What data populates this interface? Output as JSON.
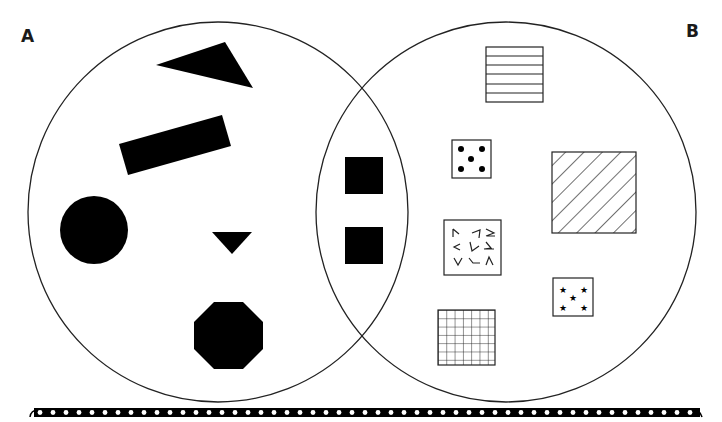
{
  "diagram": {
    "type": "venn",
    "sets": [
      {
        "id": "A",
        "label": "A",
        "center": [
          218,
          212
        ],
        "radius": 190
      },
      {
        "id": "B",
        "label": "B",
        "center": [
          506,
          212
        ],
        "radius": 190
      }
    ],
    "colors": {
      "stroke": "#222222",
      "fill": "#000000",
      "background": "#ffffff"
    },
    "only_a": [
      {
        "shape": "triangle",
        "style": "solid-black"
      },
      {
        "shape": "rectangle-rotated",
        "style": "solid-black"
      },
      {
        "shape": "circle",
        "style": "solid-black"
      },
      {
        "shape": "triangle-small-inverted",
        "style": "solid-black"
      },
      {
        "shape": "octagon",
        "style": "solid-black"
      }
    ],
    "intersection": [
      {
        "shape": "square",
        "style": "solid-black"
      },
      {
        "shape": "square",
        "style": "solid-black"
      }
    ],
    "only_b": [
      {
        "shape": "square",
        "style": "horizontal-lines"
      },
      {
        "shape": "square",
        "style": "five-dots"
      },
      {
        "shape": "square",
        "style": "diagonal-hatch"
      },
      {
        "shape": "square",
        "style": "scattered-chevrons"
      },
      {
        "shape": "square",
        "style": "five-stars"
      },
      {
        "shape": "square",
        "style": "grid"
      }
    ],
    "footer": {
      "decoration": "dotted-rail-border"
    }
  }
}
